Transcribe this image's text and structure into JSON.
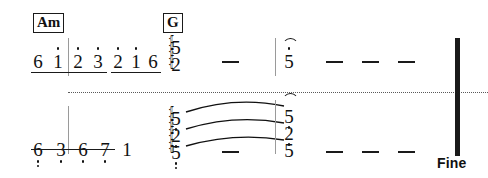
{
  "document": {
    "type": "jianpu-numbered-musical-notation",
    "width": 488,
    "height": 178,
    "ink_color": "#111111",
    "background_color": "#ffffff",
    "barline_color": "#9a9a9a"
  },
  "chords": [
    {
      "label": "Am",
      "x": 33,
      "y": 13
    },
    {
      "label": "G",
      "x": 163,
      "y": 13
    }
  ],
  "systems": [
    {
      "name": "upper-melody-system",
      "notes": [
        {
          "value": "6",
          "x": 38,
          "y": 52,
          "octave_dots_above": 0,
          "octave_dots_below": 0
        },
        {
          "value": "1",
          "x": 58,
          "y": 52,
          "octave_dots_above": 1,
          "octave_dots_below": 0
        },
        {
          "value": "2",
          "x": 78,
          "y": 52,
          "octave_dots_above": 1,
          "octave_dots_below": 0
        },
        {
          "value": "3",
          "x": 98,
          "y": 52,
          "octave_dots_above": 1,
          "octave_dots_below": 0
        },
        {
          "value": "2",
          "x": 118,
          "y": 52,
          "octave_dots_above": 1,
          "octave_dots_below": 0
        },
        {
          "value": "1",
          "x": 136,
          "y": 52,
          "octave_dots_above": 1,
          "octave_dots_below": 0
        },
        {
          "value": "6",
          "x": 153,
          "y": 52,
          "octave_dots_above": 0,
          "octave_dots_below": 0
        }
      ],
      "beams": [
        {
          "x": 31,
          "y": 72,
          "width": 76
        },
        {
          "x": 111,
          "y": 72,
          "width": 50
        }
      ],
      "chord_stacks": [
        {
          "name": "g-chord-stack",
          "x": 176,
          "arpeggio": true,
          "arpeggio_x": 168,
          "arpeggio_y": 36,
          "arpeggio_height": 32,
          "fermata": false,
          "notes": [
            {
              "value": "5",
              "y": 38,
              "octave_dots_above": 0,
              "octave_dots_below": 0
            },
            {
              "value": "2",
              "y": 55,
              "octave_dots_above": 0,
              "octave_dots_below": 0
            }
          ]
        },
        {
          "name": "fermata-chord-upper",
          "x": 289,
          "arpeggio": false,
          "fermata": true,
          "fermata_y": 38,
          "notes": [
            {
              "value": "5",
              "y": 52,
              "octave_dots_above": 1,
              "octave_dots_below": 0
            }
          ]
        }
      ],
      "dashes": [
        {
          "x": 222,
          "y": 61
        },
        {
          "x": 326,
          "y": 61
        },
        {
          "x": 362,
          "y": 61
        },
        {
          "x": 398,
          "y": 61
        }
      ],
      "barlines": [
        {
          "x": 68,
          "y": 38,
          "height": 38
        },
        {
          "x": 275,
          "y": 38,
          "height": 38
        }
      ]
    },
    {
      "name": "lower-accompaniment-system",
      "notes": [
        {
          "value": "6",
          "x": 38,
          "y": 140,
          "octave_dots_above": 0,
          "octave_dots_below": 2
        },
        {
          "value": "3",
          "x": 61,
          "y": 140,
          "octave_dots_above": 0,
          "octave_dots_below": 1
        },
        {
          "value": "6",
          "x": 83,
          "y": 140,
          "octave_dots_above": 0,
          "octave_dots_below": 1
        },
        {
          "value": "7",
          "x": 105,
          "y": 140,
          "octave_dots_above": 0,
          "octave_dots_below": 1
        },
        {
          "value": "1",
          "x": 127,
          "y": 140,
          "octave_dots_above": 0,
          "octave_dots_below": 0
        }
      ],
      "beams": [
        {
          "x": 31,
          "y": 149,
          "width": 84
        }
      ],
      "chord_stacks": [
        {
          "name": "lower-chord-stack-left",
          "x": 176,
          "arpeggio": true,
          "arpeggio_x": 168,
          "arpeggio_y": 107,
          "arpeggio_height": 48,
          "fermata": false,
          "notes": [
            {
              "value": "5",
              "y": 109,
              "octave_dots_above": 0,
              "octave_dots_below": 1
            },
            {
              "value": "2",
              "y": 126,
              "octave_dots_above": 0,
              "octave_dots_below": 1
            },
            {
              "value": "5",
              "y": 143,
              "octave_dots_above": 0,
              "octave_dots_below": 2
            }
          ]
        },
        {
          "name": "lower-chord-stack-right",
          "x": 289,
          "arpeggio": false,
          "fermata": true,
          "fermata_y": 93,
          "notes": [
            {
              "value": "5",
              "y": 107,
              "octave_dots_above": 0,
              "octave_dots_below": 1
            },
            {
              "value": "2",
              "y": 124,
              "octave_dots_above": 0,
              "octave_dots_below": 1
            },
            {
              "value": "5",
              "y": 141,
              "octave_dots_above": 0,
              "octave_dots_below": 0
            }
          ]
        }
      ],
      "dashes": [
        {
          "x": 222,
          "y": 151
        },
        {
          "x": 326,
          "y": 151
        },
        {
          "x": 362,
          "y": 151
        },
        {
          "x": 398,
          "y": 151
        }
      ],
      "barlines": [
        {
          "x": 68,
          "y": 106,
          "height": 48
        },
        {
          "x": 275,
          "y": 100,
          "height": 54
        }
      ],
      "ties": [
        {
          "x1": 186,
          "y1": 112,
          "x2": 284,
          "y2": 106,
          "bow": 13
        },
        {
          "x1": 186,
          "y1": 129,
          "x2": 284,
          "y2": 123,
          "bow": 12
        },
        {
          "x1": 186,
          "y1": 146,
          "x2": 284,
          "y2": 140,
          "bow": 11
        }
      ]
    }
  ],
  "divider": {
    "name": "system-divider",
    "x": 68,
    "y": 92,
    "width": 420
  },
  "final_barline": {
    "x": 455,
    "y": 38,
    "height": 118
  },
  "fine": {
    "label": "Fine",
    "x": 437,
    "y": 156
  }
}
